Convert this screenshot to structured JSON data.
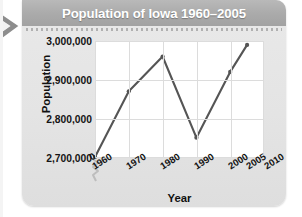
{
  "figure": {
    "title": "Population of Iowa 1960–2005",
    "banner_color": "#ababab",
    "title_color": "#ffffff",
    "card_color": "#e6e6e6",
    "plot_bg": "#ffffff",
    "grid_color": "#dcdcdc",
    "line_color": "#555555"
  },
  "chart_data": {
    "type": "line",
    "title": "Population of Iowa 1960–2005",
    "xlabel": "Year",
    "ylabel": "Population",
    "x": [
      1960,
      1970,
      1980,
      1990,
      2000,
      2005
    ],
    "values": [
      2700000,
      2870000,
      2960000,
      2750000,
      2920000,
      2990000
    ],
    "series": [
      {
        "name": "Population of Iowa",
        "values": [
          2700000,
          2870000,
          2960000,
          2750000,
          2920000,
          2990000
        ]
      }
    ],
    "x_ticks": [
      1960,
      1970,
      1980,
      1990,
      2000,
      2005,
      2010
    ],
    "x_tick_labels": [
      "1960",
      "1970",
      "1980",
      "1990",
      "2000",
      "2005",
      "2010"
    ],
    "x_origin_label": "0",
    "y_ticks": [
      2700000,
      2800000,
      2900000,
      3000000
    ],
    "y_tick_labels": [
      "2,700,000",
      "2,800,000",
      "2,900,000",
      "3,000,000"
    ],
    "xlim": [
      1960,
      2010
    ],
    "ylim": [
      2650000,
      3010000
    ],
    "grid": true,
    "legend": "none",
    "axis_break": true,
    "markers": true
  },
  "icons": {
    "chevron": "chevron-right-icon",
    "break": "axis-break-icon"
  }
}
